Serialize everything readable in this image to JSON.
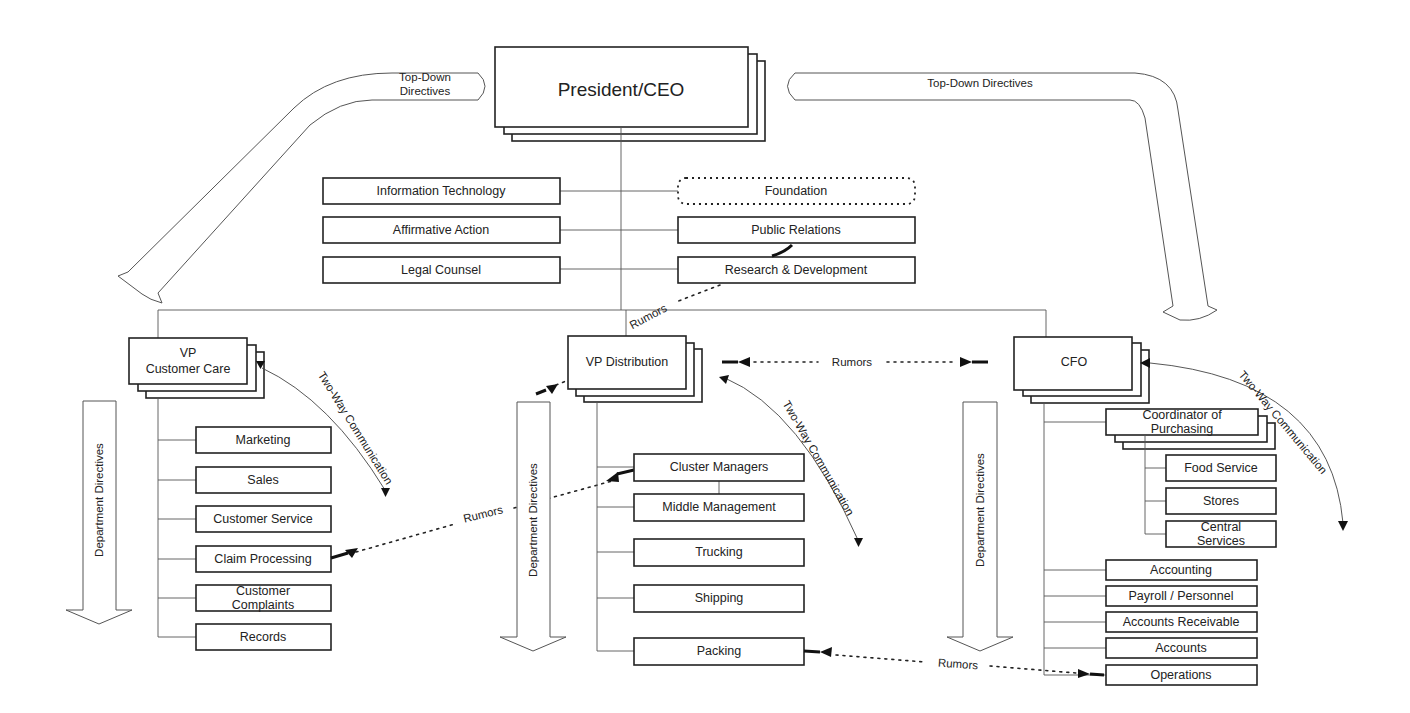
{
  "diagram": {
    "ceo": {
      "label": "President/CEO"
    },
    "staff_left": [
      {
        "label": "Information Technology"
      },
      {
        "label": "Affirmative Action"
      },
      {
        "label": "Legal Counsel"
      }
    ],
    "staff_right": [
      {
        "label": "Foundation",
        "style": "dotted"
      },
      {
        "label": "Public Relations"
      },
      {
        "label": "Research & Development"
      }
    ],
    "vps": {
      "customer_care": {
        "label_line1": "VP",
        "label_line2": "Customer Care",
        "departments": [
          {
            "label": "Marketing"
          },
          {
            "label": "Sales"
          },
          {
            "label": "Customer Service"
          },
          {
            "label": "Claim Processing"
          },
          {
            "label_line1": "Customer",
            "label_line2": "Complaints"
          },
          {
            "label": "Records"
          }
        ]
      },
      "distribution": {
        "label": "VP Distribution",
        "departments": [
          {
            "label": "Cluster Managers"
          },
          {
            "label": "Middle Management"
          },
          {
            "label": "Trucking"
          },
          {
            "label": "Shipping"
          },
          {
            "label": "Packing"
          }
        ]
      },
      "cfo": {
        "label": "CFO",
        "coordinator": {
          "label_line1": "Coordinator of",
          "label_line2": "Purchasing",
          "departments": [
            {
              "label": "Food Service"
            },
            {
              "label": "Stores"
            },
            {
              "label_line1": "Central",
              "label_line2": "Services"
            }
          ]
        },
        "departments": [
          {
            "label": "Accounting"
          },
          {
            "label": "Payroll / Personnel"
          },
          {
            "label": "Accounts Receivable"
          },
          {
            "label": "Accounts"
          },
          {
            "label": "Operations"
          }
        ]
      }
    },
    "flows": {
      "top_down_left_line1": "Top-Down",
      "top_down_left_line2": "Directives",
      "top_down_right": "Top-Down Directives",
      "department_directives": "Department Directives",
      "two_way": "Two-Way Communication",
      "rumors": "Rumors"
    }
  }
}
